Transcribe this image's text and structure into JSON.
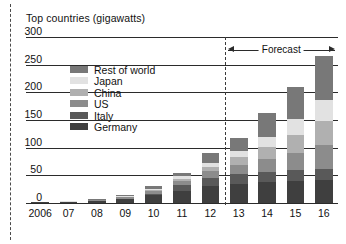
{
  "chart_data": {
    "type": "bar",
    "subtype": "stacked-bar",
    "title": "Top countries (gigawatts)",
    "xlabel": "",
    "ylabel": "",
    "ylim": [
      0,
      300
    ],
    "yticks": [
      0,
      50,
      100,
      150,
      200,
      250,
      300
    ],
    "grid": true,
    "legend_position": "inside-top-left",
    "categories": [
      "2006",
      "07",
      "08",
      "09",
      "10",
      "11",
      "12",
      "13",
      "14",
      "15",
      "16"
    ],
    "series": [
      {
        "name": "Germany",
        "color": "#3f3f3f",
        "values": [
          1,
          2,
          4,
          7,
          14,
          22,
          30,
          35,
          38,
          40,
          42
        ]
      },
      {
        "name": "Italy",
        "color": "#595959",
        "values": [
          0,
          0,
          0,
          1,
          3,
          10,
          16,
          17,
          18,
          19,
          20
        ]
      },
      {
        "name": "US",
        "color": "#8c8c8c",
        "values": [
          0,
          1,
          1,
          2,
          4,
          7,
          11,
          17,
          24,
          32,
          42
        ]
      },
      {
        "name": "China",
        "color": "#b0b0b0",
        "values": [
          0,
          0,
          0,
          0,
          2,
          4,
          8,
          14,
          22,
          32,
          44
        ]
      },
      {
        "name": "Japan",
        "color": "#e2e2e2",
        "values": [
          0,
          1,
          1,
          2,
          3,
          5,
          7,
          11,
          18,
          28,
          38
        ]
      },
      {
        "name": "Rest of world",
        "color": "#787878",
        "values": [
          0,
          0,
          1,
          2,
          4,
          7,
          18,
          24,
          42,
          58,
          80
        ]
      }
    ],
    "totals": [
      1,
      4,
      7,
      14,
      30,
      55,
      90,
      118,
      162,
      209,
      266
    ],
    "annotation": {
      "label": "Forecast",
      "from_category": "13",
      "to_category": "16",
      "divider_between": [
        "12",
        "13"
      ],
      "style": "double-headed-arrow"
    }
  },
  "legend": {
    "items": [
      {
        "label": "Rest of world",
        "color": "#787878"
      },
      {
        "label": "Japan",
        "color": "#e2e2e2"
      },
      {
        "label": "China",
        "color": "#b0b0b0"
      },
      {
        "label": "US",
        "color": "#8c8c8c"
      },
      {
        "label": "Italy",
        "color": "#595959"
      },
      {
        "label": "Germany",
        "color": "#3f3f3f"
      }
    ]
  }
}
